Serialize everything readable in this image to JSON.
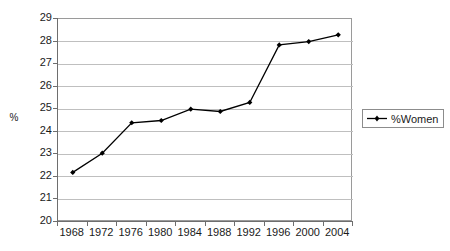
{
  "chart_data": {
    "type": "line",
    "title": "",
    "xlabel": "",
    "ylabel": "%",
    "categories": [
      "1968",
      "1972",
      "1976",
      "1980",
      "1984",
      "1988",
      "1992",
      "1996",
      "2000",
      "2004"
    ],
    "x": [
      1968,
      1972,
      1976,
      1980,
      1984,
      1988,
      1992,
      1996,
      2000,
      2004
    ],
    "series": [
      {
        "name": "%Women",
        "values": [
          22.2,
          23.05,
          24.4,
          24.5,
          25.0,
          24.9,
          25.3,
          27.85,
          28.0,
          28.3
        ],
        "color": "#000000",
        "marker": "diamond"
      }
    ],
    "ylim": [
      20,
      29
    ],
    "y_ticks": [
      "29",
      "28",
      "27",
      "26",
      "25",
      "24",
      "23",
      "22",
      "21",
      "20"
    ],
    "y_tick_values": [
      29,
      28,
      27,
      26,
      25,
      24,
      23,
      22,
      21,
      20
    ],
    "grid": "horizontal",
    "grid_color": "#bfbfbf",
    "legend_position": "right",
    "plot_border_color": "#9a9a9a",
    "axis_color": "#6e6e6e",
    "background": "#ffffff"
  },
  "legend": {
    "entries": [
      {
        "label": "%Women",
        "color": "#000000"
      }
    ]
  },
  "axes": {
    "y_title": "%"
  }
}
